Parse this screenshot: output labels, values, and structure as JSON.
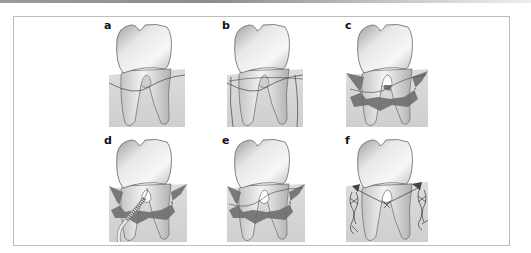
{
  "figure": {
    "type": "dental surgical illustration sequence",
    "panel_count": 6,
    "colors": {
      "frame_border": "#bdbdbd",
      "gingiva": "#d6d6d6",
      "tooth_light": "#f2f2f2",
      "tooth_dark": "#bfbfbf",
      "flap_dark": "#6e6e6e",
      "outline": "#555555"
    },
    "panels": [
      {
        "label": "a",
        "stage": "incision-outline"
      },
      {
        "label": "b",
        "stage": "vertical-incisions"
      },
      {
        "label": "c",
        "stage": "flap-reflected"
      },
      {
        "label": "d",
        "stage": "instrumentation"
      },
      {
        "label": "e",
        "stage": "flap-repositioned"
      },
      {
        "label": "f",
        "stage": "sutured"
      }
    ]
  }
}
